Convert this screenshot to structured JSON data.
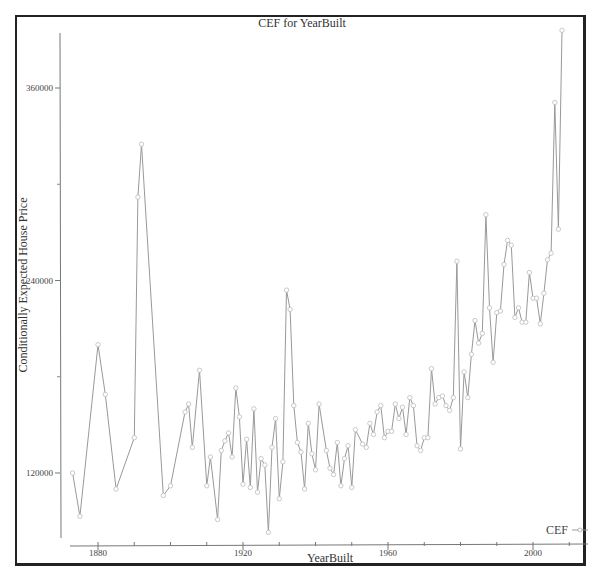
{
  "chart_data": {
    "type": "line",
    "title": "CEF for YearBuilt",
    "xlabel": "YearBuilt",
    "ylabel": "Conditionally Expected House Price",
    "x_ticks": [
      1880,
      1920,
      1960,
      2000
    ],
    "y_ticks": [
      120000,
      240000,
      360000
    ],
    "y_minor_ticks": [
      180000,
      300000
    ],
    "xlim": [
      1872,
      2009
    ],
    "ylim": [
      80000,
      400000
    ],
    "grid": false,
    "legend_position": "bottom-right",
    "series": [
      {
        "name": "CEF",
        "color": "#999999",
        "marker": "circle",
        "x": [
          1873,
          1875,
          1880,
          1882,
          1885,
          1890,
          1891,
          1892,
          1898,
          1900,
          1904,
          1905,
          1906,
          1908,
          1910,
          1911,
          1913,
          1914,
          1915,
          1916,
          1917,
          1918,
          1919,
          1920,
          1921,
          1922,
          1923,
          1924,
          1925,
          1926,
          1927,
          1928,
          1929,
          1930,
          1931,
          1932,
          1933,
          1934,
          1935,
          1936,
          1937,
          1938,
          1939,
          1940,
          1941,
          1943,
          1944,
          1945,
          1946,
          1947,
          1948,
          1949,
          1950,
          1951,
          1953,
          1954,
          1955,
          1956,
          1957,
          1958,
          1959,
          1960,
          1961,
          1962,
          1963,
          1964,
          1965,
          1966,
          1967,
          1968,
          1969,
          1970,
          1971,
          1972,
          1973,
          1974,
          1975,
          1976,
          1977,
          1978,
          1979,
          1980,
          1981,
          1982,
          1983,
          1984,
          1985,
          1986,
          1987,
          1988,
          1989,
          1990,
          1991,
          1992,
          1993,
          1994,
          1995,
          1996,
          1997,
          1998,
          1999,
          2000,
          2001,
          2002,
          2003,
          2004,
          2005,
          2006,
          2007,
          2008
        ],
        "values": [
          120000,
          93000,
          200000,
          169000,
          110000,
          142000,
          292000,
          325000,
          106000,
          112000,
          158000,
          163000,
          136000,
          184000,
          112000,
          130000,
          91000,
          134000,
          140000,
          145000,
          130000,
          173000,
          155000,
          113000,
          141000,
          111000,
          160000,
          108000,
          129000,
          125000,
          83000,
          136000,
          154000,
          104000,
          127000,
          234000,
          222000,
          162000,
          139000,
          133000,
          110000,
          151000,
          132000,
          122000,
          163000,
          134000,
          123000,
          119000,
          139000,
          112000,
          129000,
          137000,
          111000,
          147000,
          138000,
          136000,
          151000,
          144000,
          158000,
          162000,
          142000,
          146000,
          146000,
          163000,
          154000,
          161000,
          144000,
          167000,
          162000,
          137000,
          134000,
          142000,
          142000,
          185000,
          163000,
          167000,
          168000,
          162000,
          159000,
          167000,
          252000,
          135000,
          183000,
          167000,
          194000,
          215000,
          201000,
          207000,
          281000,
          223000,
          189000,
          220000,
          221000,
          250000,
          265000,
          262000,
          217000,
          223000,
          214000,
          214000,
          245000,
          229000,
          229000,
          213000,
          232000,
          253000,
          257000,
          351000,
          272000,
          396000
        ]
      }
    ]
  },
  "labels": {
    "title": "CEF for YearBuilt",
    "xlabel": "YearBuilt",
    "ylabel": "Conditionally Expected House Price",
    "legend": "CEF",
    "x_tick_labels": [
      "1880",
      "1920",
      "1960",
      "2000"
    ],
    "y_tick_labels": [
      "360000",
      "240000",
      "120000"
    ]
  },
  "colors": {
    "line": "#999999",
    "axis": "#777777",
    "frame": "#222222",
    "text": "#333333"
  }
}
